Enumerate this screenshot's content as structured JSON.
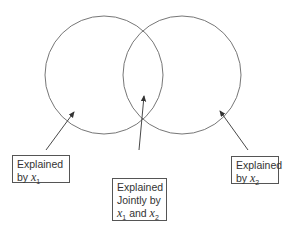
{
  "diagram": {
    "type": "venn",
    "sets": [
      {
        "name": "x1",
        "label": "x",
        "subscript": "1"
      },
      {
        "name": "x2",
        "label": "x",
        "subscript": "2"
      }
    ],
    "labels": {
      "left": {
        "line1": "Explained",
        "line2_prefix": "by ",
        "var": "x",
        "sub": "1"
      },
      "middle": {
        "line1": "Explained",
        "line2": "Jointly by",
        "var1": "x",
        "sub1": "1",
        "conj": " and ",
        "var2": "x",
        "sub2": "2"
      },
      "right": {
        "line1": "Explained",
        "line2_prefix": "by ",
        "var": "x",
        "sub": "2"
      }
    },
    "colors": {
      "stroke": "#555555",
      "text": "#333333"
    }
  }
}
